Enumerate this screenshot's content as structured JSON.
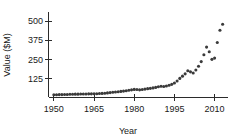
{
  "chart_data": {
    "type": "scatter",
    "title": "",
    "xlabel": "Year",
    "ylabel": "Value ($M)",
    "xlim": [
      1948,
      2015
    ],
    "ylim": [
      0,
      560
    ],
    "grid": false,
    "legend": null,
    "x_ticks": [
      1950,
      1965,
      1980,
      1995,
      2010
    ],
    "y_ticks": [
      125,
      250,
      375,
      500
    ],
    "point_color": "#3a3a3a",
    "axis_color": "#2b2b2b",
    "series": [
      {
        "name": "Value",
        "x": [
          1950,
          1951,
          1952,
          1953,
          1954,
          1955,
          1956,
          1957,
          1958,
          1959,
          1960,
          1961,
          1962,
          1963,
          1964,
          1965,
          1966,
          1967,
          1968,
          1969,
          1970,
          1971,
          1972,
          1973,
          1974,
          1975,
          1976,
          1977,
          1978,
          1979,
          1980,
          1981,
          1982,
          1983,
          1984,
          1985,
          1986,
          1987,
          1988,
          1989,
          1990,
          1991,
          1992,
          1993,
          1994,
          1995,
          1996,
          1997,
          1998,
          1999,
          2000,
          2001,
          2002,
          2003,
          2004,
          2005,
          2006,
          2007,
          2008,
          2009,
          2010,
          2011,
          2012,
          2013
        ],
        "y": [
          18,
          18,
          19,
          19,
          20,
          20,
          21,
          21,
          22,
          22,
          23,
          23,
          23,
          24,
          24,
          25,
          25,
          26,
          27,
          28,
          30,
          32,
          34,
          36,
          38,
          40,
          42,
          44,
          47,
          50,
          53,
          52,
          50,
          52,
          55,
          58,
          60,
          63,
          66,
          70,
          74,
          72,
          75,
          80,
          86,
          95,
          108,
          125,
          140,
          155,
          175,
          168,
          160,
          180,
          205,
          235,
          280,
          330,
          300,
          250,
          258,
          360,
          440,
          480
        ]
      }
    ],
    "annotations": []
  }
}
